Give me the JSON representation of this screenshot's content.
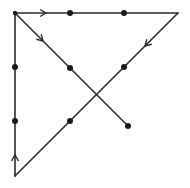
{
  "diagram": {
    "stroke_color": "#2a2a2a",
    "dot_color": "#1a1a1a",
    "dots": [
      {
        "x": 70,
        "y": 13
      },
      {
        "x": 124,
        "y": 13
      },
      {
        "x": 15,
        "y": 67
      },
      {
        "x": 70,
        "y": 68
      },
      {
        "x": 124,
        "y": 67
      },
      {
        "x": 15,
        "y": 121
      },
      {
        "x": 70,
        "y": 121
      },
      {
        "x": 128,
        "y": 126
      }
    ],
    "corner_dot": {
      "x": 15,
      "y": 13
    },
    "path": [
      {
        "x": 15,
        "y": 176
      },
      {
        "x": 15,
        "y": 13
      },
      {
        "x": 178,
        "y": 13
      },
      {
        "x": 15,
        "y": 176
      }
    ],
    "segments": [
      {
        "from": {
          "x": 15,
          "y": 176
        },
        "to": {
          "x": 15,
          "y": 13
        },
        "arrow": {
          "x": 15,
          "y": 155,
          "dir": "up"
        }
      },
      {
        "from": {
          "x": 15,
          "y": 13
        },
        "to": {
          "x": 178,
          "y": 13
        },
        "arrow": {
          "x": 46,
          "y": 13,
          "dir": "right"
        }
      },
      {
        "from": {
          "x": 178,
          "y": 13
        },
        "to": {
          "x": 15,
          "y": 176
        },
        "arrow": {
          "x": 145,
          "y": 46,
          "dir": "down-left"
        }
      },
      {
        "from": {
          "x": 15,
          "y": 13
        },
        "to": {
          "x": 128,
          "y": 126
        },
        "arrow": {
          "x": 43,
          "y": 41,
          "dir": "down-right"
        }
      }
    ]
  }
}
